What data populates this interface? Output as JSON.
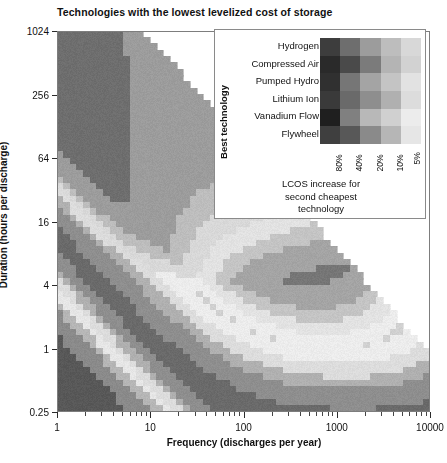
{
  "chart_data": {
    "type": "heatmap",
    "title": "Technologies with the lowest levelized cost of storage",
    "xlabel": "Frequency (discharges per year)",
    "ylabel": "Duration (hours per discharge)",
    "xscale": "log",
    "yscale": "log",
    "xlim": [
      1,
      10000
    ],
    "ylim": [
      0.25,
      1024
    ],
    "xticks": [
      "1",
      "10",
      "100",
      "1000",
      "10000"
    ],
    "xtick_values": [
      1,
      10,
      100,
      1000,
      10000
    ],
    "yticks": [
      "1024",
      "256",
      "64",
      "16",
      "4",
      "1",
      "0.25"
    ],
    "ytick_values": [
      1024,
      256,
      64,
      16,
      4,
      1,
      0.25
    ],
    "grid": false,
    "colormap": "grayscale",
    "legend_position": "inside-top-right",
    "note": "Upper-right triangular region above the diagonal (duration x frequency > 8760 h/yr) is blank - physically infeasible.",
    "technologies": [
      "Hydrogen",
      "Compressed Air",
      "Pumped Hydro",
      "Lithium Ion",
      "Vanadium Flow",
      "Flywheel"
    ],
    "lcos_levels": [
      "80%",
      "40%",
      "20%",
      "10%",
      "5%"
    ],
    "legend_swatches": [
      [
        "#3d3d3d",
        "#6e6e6e",
        "#9c9c9c",
        "#bdbdbd",
        "#d8d8d8"
      ],
      [
        "#2a2a2a",
        "#4a4a4a",
        "#7b7b7b",
        "#b4b4b4",
        "#d2d2d2"
      ],
      [
        "#303030",
        "#767676",
        "#a4a4a4",
        "#c4c4c4",
        "#e2e2e2"
      ],
      [
        "#3a3a3a",
        "#6a6a6a",
        "#8e8e8e",
        "#b0b0b0",
        "#dcdcdc"
      ],
      [
        "#1f1f1f",
        "#808080",
        "#b8b8b8",
        "#d0d0d0",
        "#ececec"
      ],
      [
        "#3f3f3f",
        "#585858",
        "#8a8a8a",
        "#b6b6b6",
        "#e6e6e6"
      ]
    ],
    "legend_column_header": "LCOS increase for",
    "legend_caption_line1": "LCOS increase for",
    "legend_caption_line2": "second cheapest",
    "legend_caption_line3": "technology",
    "legend_axis_title": "Best technology",
    "regions": [
      {
        "technology": "Flywheel",
        "x_range": [
          300,
          10000
        ],
        "y_range": [
          0.25,
          2
        ]
      },
      {
        "technology": "Lithium Ion",
        "x_range": [
          1,
          300
        ],
        "y_range": [
          0.25,
          2
        ]
      },
      {
        "technology": "Vanadium Flow",
        "x_range": [
          20,
          400
        ],
        "y_range": [
          2,
          30
        ]
      },
      {
        "technology": "Pumped Hydro",
        "x_range": [
          1,
          20
        ],
        "y_range": [
          2,
          1024
        ]
      },
      {
        "technology": "Compressed Air",
        "x_range": [
          1,
          12
        ],
        "y_range": [
          30,
          400
        ]
      },
      {
        "technology": "Hydrogen",
        "x_range": [
          1,
          10
        ],
        "y_range": [
          200,
          1024
        ]
      }
    ]
  },
  "legend": {
    "axis_title": "Best technology",
    "row_labels": [
      "Hydrogen",
      "Compressed Air",
      "Pumped Hydro",
      "Lithium Ion",
      "Vanadium Flow",
      "Flywheel"
    ],
    "col_labels": [
      "80%",
      "40%",
      "20%",
      "10%",
      "5%"
    ],
    "caption": [
      "LCOS increase for",
      "second cheapest",
      "technology"
    ]
  }
}
